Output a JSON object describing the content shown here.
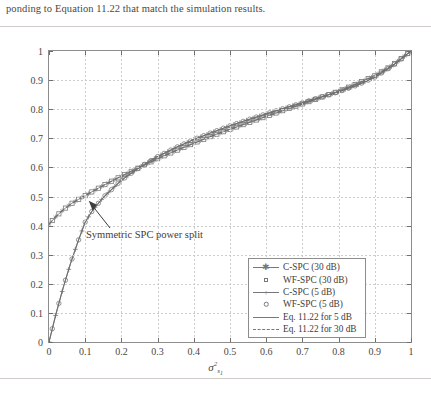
{
  "caption": "ponding to Equation 11.22 that match the simulation results.",
  "chart_data": {
    "type": "line",
    "title": "",
    "xlabel": "σ²",
    "xlabel_sub": "s₁",
    "ylabel": "E(σ*)",
    "xlim": [
      0,
      1
    ],
    "ylim": [
      0,
      1
    ],
    "grid": true,
    "legend_position": "bottom-right",
    "xticks": [
      "0",
      "0.1",
      "0.2",
      "0.3",
      "0.4",
      "0.5",
      "0.6",
      "0.7",
      "0.8",
      "0.9",
      "1"
    ],
    "yticks": [
      "0",
      "0.1",
      "0.2",
      "0.3",
      "0.4",
      "0.5",
      "0.6",
      "0.7",
      "0.8",
      "0.9",
      "1"
    ],
    "annotations": [
      {
        "text": "Symmetric SPC power split",
        "x": 0.105,
        "y": 0.495
      }
    ],
    "x": [
      0,
      0.02,
      0.04,
      0.06,
      0.08,
      0.1,
      0.12,
      0.15,
      0.2,
      0.25,
      0.3,
      0.35,
      0.4,
      0.45,
      0.5,
      0.55,
      0.6,
      0.65,
      0.7,
      0.75,
      0.8,
      0.85,
      0.9,
      0.95,
      1
    ],
    "series": [
      {
        "name": "C-SPC (30 dB)",
        "marker": "asterisk",
        "style": "line-marker",
        "values": [
          0.405,
          0.432,
          0.455,
          0.474,
          0.489,
          0.503,
          0.517,
          0.538,
          0.57,
          0.6,
          0.63,
          0.657,
          0.683,
          0.708,
          0.731,
          0.753,
          0.775,
          0.797,
          0.818,
          0.84,
          0.862,
          0.887,
          0.915,
          0.952,
          1.0
        ]
      },
      {
        "name": "WF-SPC (30 dB)",
        "marker": "square",
        "style": "marker-only",
        "values": [
          0.405,
          0.432,
          0.455,
          0.474,
          0.489,
          0.503,
          0.517,
          0.538,
          0.57,
          0.6,
          0.63,
          0.657,
          0.683,
          0.708,
          0.731,
          0.753,
          0.775,
          0.797,
          0.818,
          0.84,
          0.862,
          0.887,
          0.915,
          0.952,
          1.0
        ]
      },
      {
        "name": "C-SPC (5 dB)",
        "marker": "plus",
        "style": "line-marker",
        "values": [
          0.0,
          0.1,
          0.19,
          0.272,
          0.345,
          0.412,
          0.452,
          0.497,
          0.556,
          0.6,
          0.637,
          0.668,
          0.696,
          0.72,
          0.743,
          0.764,
          0.784,
          0.803,
          0.822,
          0.841,
          0.86,
          0.882,
          0.91,
          0.95,
          1.0
        ]
      },
      {
        "name": "WF-SPC (5 dB)",
        "marker": "circle",
        "style": "marker-only",
        "values": [
          0.0,
          0.1,
          0.19,
          0.272,
          0.345,
          0.412,
          0.452,
          0.497,
          0.556,
          0.6,
          0.637,
          0.668,
          0.696,
          0.72,
          0.743,
          0.764,
          0.784,
          0.803,
          0.822,
          0.841,
          0.86,
          0.882,
          0.91,
          0.95,
          1.0
        ]
      },
      {
        "name": "Eq. 11.22 for 5 dB",
        "marker": "none",
        "style": "solid",
        "values": [
          0.0,
          0.1,
          0.19,
          0.272,
          0.345,
          0.412,
          0.452,
          0.497,
          0.556,
          0.6,
          0.637,
          0.668,
          0.696,
          0.72,
          0.743,
          0.764,
          0.784,
          0.803,
          0.822,
          0.841,
          0.86,
          0.882,
          0.91,
          0.95,
          1.0
        ]
      },
      {
        "name": "Eq. 11.22 for 30 dB",
        "marker": "none",
        "style": "dashed",
        "values": [
          0.405,
          0.432,
          0.455,
          0.474,
          0.489,
          0.503,
          0.517,
          0.538,
          0.57,
          0.6,
          0.63,
          0.657,
          0.683,
          0.708,
          0.731,
          0.753,
          0.775,
          0.797,
          0.818,
          0.84,
          0.862,
          0.887,
          0.915,
          0.952,
          1.0
        ]
      }
    ],
    "legend": [
      {
        "label": "C-SPC (30 dB)",
        "key": "line-asterisk"
      },
      {
        "label": "WF-SPC (30 dB)",
        "key": "square"
      },
      {
        "label": "C-SPC (5 dB)",
        "key": "line-plus"
      },
      {
        "label": "WF-SPC (5 dB)",
        "key": "circle"
      },
      {
        "label": "Eq. 11.22 for 5 dB",
        "key": "solid-line"
      },
      {
        "label": "Eq. 11.22 for 30 dB",
        "key": "dashed-line"
      }
    ]
  }
}
